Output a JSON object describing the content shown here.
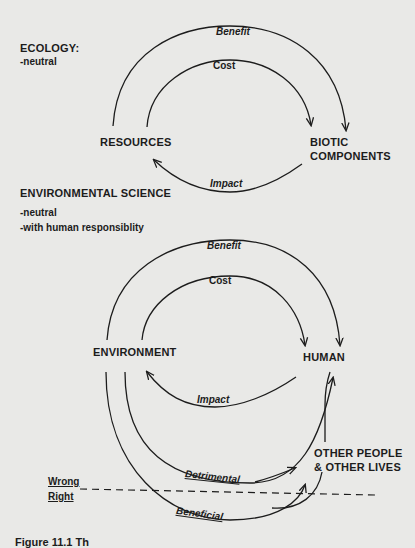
{
  "ecology": {
    "heading": "ECOLOGY:",
    "notes": [
      "-neutral"
    ],
    "nodes": {
      "left": "RESOURCES",
      "right_line1": "BIOTIC",
      "right_line2": "COMPONENTS"
    },
    "arcs": {
      "outer": "Benefit",
      "inner": "Cost",
      "return": "Impact"
    }
  },
  "environmental_science": {
    "heading": "ENVIRONMENTAL SCIENCE",
    "notes": [
      "-neutral",
      "-with human responsiblity"
    ],
    "nodes": {
      "left": "ENVIRONMENT",
      "right": "HUMAN",
      "others_line1": "OTHER PEOPLE",
      "others_line2": "& OTHER LIVES"
    },
    "arcs": {
      "outer": "Benefit",
      "inner": "Cost",
      "return": "Impact",
      "detrimental": "Detrimental",
      "beneficial": "Beneficial"
    },
    "divider": {
      "above": "Wrong",
      "below": "Right"
    }
  },
  "caption": "Figure 11.1  Th",
  "colors": {
    "background": "#e9e9e7",
    "ink": "#1c1c1c"
  }
}
